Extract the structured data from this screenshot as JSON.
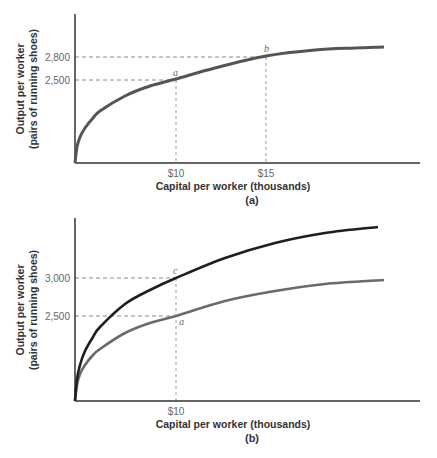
{
  "chart_data": [
    {
      "type": "line",
      "panel": "(a)",
      "caption": "(a)",
      "xlabel": "Capital per worker (thousands)",
      "ylabel_line1": "Output per worker",
      "ylabel_line2": "(pairs of running shoes)",
      "x_ticks": [
        "$10",
        "$15"
      ],
      "y_ticks": [
        "2,500",
        "2,800"
      ],
      "grid": false,
      "series": [
        {
          "name": "Production function",
          "color": "#555555",
          "points": [
            {
              "x": 10,
              "y": 2500,
              "label": "a"
            },
            {
              "x": 15,
              "y": 2800,
              "label": "b"
            }
          ]
        }
      ],
      "annotations": [
        {
          "label": "a",
          "x": "$10",
          "y": "2,500"
        },
        {
          "label": "b",
          "x": "$15",
          "y": "2,800"
        }
      ]
    },
    {
      "type": "line",
      "panel": "(b)",
      "caption": "(b)",
      "xlabel": "Capital per worker (thousands)",
      "ylabel_line1": "Output per worker",
      "ylabel_line2": "(pairs of running shoes)",
      "x_ticks": [
        "$10"
      ],
      "y_ticks": [
        "2,500",
        "3,000"
      ],
      "grid": false,
      "series": [
        {
          "name": "Original production function",
          "color": "#6a6a6a",
          "points": [
            {
              "x": 10,
              "y": 2500,
              "label": "a"
            }
          ]
        },
        {
          "name": "Shifted production function (technological progress)",
          "color": "#1e1e1e",
          "points": [
            {
              "x": 10,
              "y": 3000,
              "label": "c"
            }
          ]
        }
      ],
      "annotations": [
        {
          "label": "a",
          "x": "$10",
          "y": "2,500"
        },
        {
          "label": "c",
          "x": "$10",
          "y": "3,000"
        }
      ]
    }
  ],
  "panel_a": {
    "ylabel_line1": "Output per worker",
    "ylabel_line2": "(pairs of running shoes)",
    "ytick_2800": "2,800",
    "ytick_2500": "2,500",
    "xtick_10": "$10",
    "xtick_15": "$15",
    "point_a": "a",
    "point_b": "b",
    "xlabel": "Capital per worker (thousands)",
    "caption": "(a)"
  },
  "panel_b": {
    "ylabel_line1": "Output per worker",
    "ylabel_line2": "(pairs of running shoes)",
    "ytick_3000": "3,000",
    "ytick_2500": "2,500",
    "xtick_10": "$10",
    "point_c": "c",
    "point_a": "a",
    "xlabel": "Capital per worker (thousands)",
    "caption": "(b)"
  },
  "curves": {
    "a_main": {
      "origin": [
        75,
        163
      ],
      "color": "#555555",
      "width": 3,
      "samples": [
        [
          0,
          0
        ],
        [
          2,
          16
        ],
        [
          5,
          26
        ],
        [
          10,
          35
        ],
        [
          18,
          45
        ],
        [
          25,
          52
        ],
        [
          50,
          67
        ],
        [
          75,
          77
        ],
        [
          101,
          84
        ],
        [
          140,
          95
        ],
        [
          191,
          107
        ],
        [
          240,
          113
        ],
        [
          280,
          115
        ],
        [
          309,
          116
        ]
      ]
    },
    "b_gray": {
      "origin": [
        75,
        401
      ],
      "color": "#6a6a6a",
      "width": 2.6,
      "samples": [
        [
          0,
          0
        ],
        [
          2,
          16
        ],
        [
          5,
          27
        ],
        [
          10,
          36
        ],
        [
          18,
          46
        ],
        [
          25,
          52
        ],
        [
          50,
          68
        ],
        [
          75,
          78
        ],
        [
          101,
          85
        ],
        [
          150,
          100
        ],
        [
          200,
          110
        ],
        [
          250,
          117
        ],
        [
          309,
          121
        ]
      ]
    },
    "b_black": {
      "origin": [
        75,
        401
      ],
      "color": "#1e1e1e",
      "width": 2.6,
      "samples": [
        [
          0,
          0
        ],
        [
          2,
          22
        ],
        [
          5,
          36
        ],
        [
          10,
          50
        ],
        [
          18,
          64
        ],
        [
          25,
          74
        ],
        [
          50,
          97
        ],
        [
          75,
          111
        ],
        [
          101,
          123
        ],
        [
          150,
          143
        ],
        [
          200,
          158
        ],
        [
          250,
          168
        ],
        [
          303,
          174
        ]
      ]
    }
  }
}
